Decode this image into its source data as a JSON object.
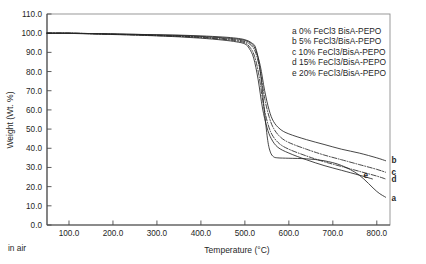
{
  "figure": {
    "note": "in air",
    "frame": {
      "left": 47,
      "top": 14,
      "right": 390,
      "bottom": 225
    }
  },
  "chart_data": {
    "type": "line",
    "title": "",
    "xlabel": "Temperature (°C)",
    "ylabel": "Weight (Wt. %)",
    "xlim": [
      50,
      830
    ],
    "ylim": [
      0,
      110
    ],
    "grid": false,
    "legend_position": "upper-right-outside",
    "xticks": [
      "100.0",
      "200.0",
      "300.0",
      "400.0",
      "500.0",
      "600.0",
      "700.0",
      "800.0"
    ],
    "xtick_values": [
      100,
      200,
      300,
      400,
      500,
      600,
      700,
      800
    ],
    "yticks": [
      "0.0",
      "10.0",
      "20.0",
      "30.0",
      "40.0",
      "50.0",
      "60.0",
      "70.0",
      "80.0",
      "90.0",
      "100.0",
      "110.0"
    ],
    "ytick_values": [
      0,
      10,
      20,
      30,
      40,
      50,
      60,
      70,
      80,
      90,
      100,
      110
    ],
    "annotations": [
      "in air"
    ],
    "curve_tags": [
      "a",
      "b",
      "c",
      "d",
      "e"
    ],
    "legend": [
      {
        "key": "a",
        "label": "a 0% FeCl3 BisA-PEPO"
      },
      {
        "key": "b",
        "label": "b 5% FeCl3/BisA-PEPO"
      },
      {
        "key": "c",
        "label": "c 10% FeCl3/BisA-PEPO"
      },
      {
        "key": "d",
        "label": "d 15% FeCl3/BisA-PEPO"
      },
      {
        "key": "e",
        "label": "e 20% FeCl3/BisA-PEPO"
      }
    ],
    "series": [
      {
        "name": "a 0% FeCl3 BisA-PEPO",
        "key": "a",
        "style": "solid",
        "x": [
          50,
          100,
          150,
          200,
          250,
          300,
          350,
          400,
          450,
          480,
          500,
          515,
          525,
          535,
          545,
          552,
          558,
          565,
          575,
          600,
          640,
          680,
          720,
          760,
          800,
          820
        ],
        "y": [
          100,
          100,
          99.8,
          99.6,
          99.4,
          99.2,
          99.0,
          98.6,
          98.0,
          97.4,
          96.6,
          95.0,
          92.0,
          80.0,
          58.0,
          44.0,
          38.0,
          35.6,
          35.0,
          34.8,
          34.5,
          33.5,
          31.0,
          26.0,
          17.5,
          14.5
        ]
      },
      {
        "name": "b 5% FeCl3/BisA-PEPO",
        "key": "b",
        "style": "solid",
        "x": [
          50,
          100,
          150,
          200,
          250,
          300,
          350,
          400,
          450,
          480,
          500,
          515,
          525,
          535,
          545,
          555,
          565,
          580,
          600,
          640,
          680,
          720,
          760,
          800,
          820
        ],
        "y": [
          100,
          100,
          99.8,
          99.6,
          99.4,
          99.1,
          98.8,
          98.3,
          97.6,
          97.0,
          96.2,
          94.5,
          91.0,
          83.0,
          70.0,
          60.0,
          54.0,
          50.0,
          47.5,
          44.5,
          42.0,
          39.5,
          37.5,
          35.0,
          33.5
        ]
      },
      {
        "name": "c 10% FeCl3/BisA-PEPO",
        "key": "c",
        "style": "dashdot",
        "x": [
          50,
          100,
          150,
          200,
          250,
          300,
          350,
          400,
          450,
          480,
          500,
          515,
          525,
          535,
          545,
          555,
          565,
          580,
          600,
          640,
          680,
          720,
          760,
          800,
          820
        ],
        "y": [
          100,
          100,
          99.8,
          99.5,
          99.2,
          98.9,
          98.5,
          98.0,
          97.2,
          96.5,
          95.6,
          93.5,
          89.5,
          80.0,
          66.0,
          56.5,
          50.5,
          46.0,
          43.0,
          39.5,
          36.5,
          34.0,
          31.5,
          29.0,
          27.5
        ]
      },
      {
        "name": "d 15% FeCl3/BisA-PEPO",
        "key": "d",
        "style": "dashdot",
        "x": [
          50,
          100,
          150,
          200,
          250,
          300,
          350,
          400,
          450,
          480,
          500,
          512,
          522,
          532,
          542,
          552,
          562,
          578,
          600,
          640,
          680,
          720,
          760,
          800,
          820
        ],
        "y": [
          100,
          100,
          99.7,
          99.4,
          99.1,
          98.7,
          98.3,
          97.7,
          96.8,
          96.0,
          95.0,
          92.5,
          88.0,
          78.0,
          63.0,
          53.0,
          47.0,
          42.5,
          39.5,
          36.0,
          33.0,
          30.5,
          28.0,
          25.5,
          24.0
        ]
      },
      {
        "name": "e 20% FeCl3/BisA-PEPO",
        "key": "e",
        "style": "solid",
        "x": [
          50,
          100,
          150,
          200,
          250,
          300,
          350,
          400,
          450,
          480,
          500,
          510,
          520,
          530,
          540,
          550,
          560,
          575,
          600,
          640,
          680,
          720,
          760,
          790
        ],
        "y": [
          100,
          99.9,
          99.6,
          99.3,
          99.0,
          98.6,
          98.1,
          97.4,
          96.4,
          95.5,
          94.4,
          92.0,
          87.0,
          76.0,
          61.0,
          51.0,
          45.0,
          40.5,
          37.5,
          34.0,
          31.0,
          28.5,
          26.0,
          24.0
        ]
      }
    ]
  }
}
